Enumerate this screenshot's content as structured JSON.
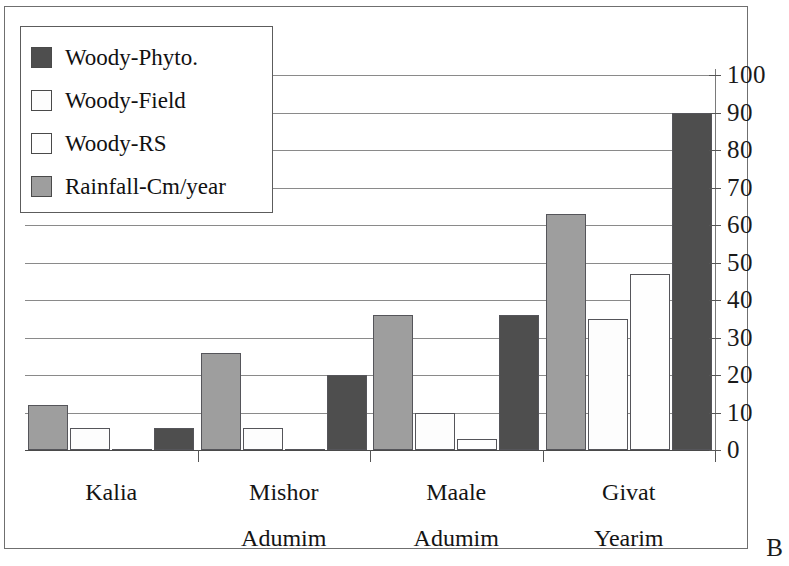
{
  "chart_data": {
    "type": "bar",
    "title": "",
    "subtitle": "",
    "xlabel": "",
    "ylabel": "",
    "ylim": [
      0,
      100
    ],
    "ytick_step": 10,
    "yticks": [
      "100",
      "90",
      "80",
      "70",
      "60",
      "50",
      "40",
      "30",
      "20",
      "10",
      "0"
    ],
    "grid": true,
    "legend_position": "top-left",
    "categories": [
      "Kalia",
      "Mishor Adumim",
      "Maale Adumim",
      "Givat Yearim"
    ],
    "category_lines": [
      {
        "line1": "Kalia",
        "line2": ""
      },
      {
        "line1": "Mishor",
        "line2": "Adumim"
      },
      {
        "line1": "Maale",
        "line2": "Adumim"
      },
      {
        "line1": "Givat",
        "line2": "Yearim"
      }
    ],
    "series": [
      {
        "name": "Woody-Phyto.",
        "color": "#4e4e4e",
        "values": [
          6,
          20,
          36,
          90
        ]
      },
      {
        "name": "Woody-Field",
        "color": "#fdfdfd",
        "values": [
          6,
          6,
          10,
          35
        ]
      },
      {
        "name": "Woody-RS",
        "color": "#fefefe",
        "values": [
          0,
          0,
          3,
          47
        ]
      },
      {
        "name": "Rainfall-Cm/year",
        "color": "#9e9e9e",
        "values": [
          12,
          26,
          36,
          63
        ]
      }
    ],
    "series_draw_order": [
      "Rainfall-Cm/year",
      "Woody-Field",
      "Woody-RS",
      "Woody-Phyto."
    ],
    "annotations": [
      {
        "name": "panel-letter",
        "text": "B"
      }
    ]
  },
  "legend": {
    "items": [
      {
        "label": "Woody-Phyto.",
        "swatch_color": "#4e4e4e",
        "swatch_name": "legend-swatch-woody-phyto"
      },
      {
        "label": "Woody-Field",
        "swatch_color": "#fdfdfd",
        "swatch_name": "legend-swatch-woody-field"
      },
      {
        "label": "Woody-RS",
        "swatch_color": "#fefefe",
        "swatch_name": "legend-swatch-woody-rs"
      },
      {
        "label": "Rainfall-Cm/year",
        "swatch_color": "#9e9e9e",
        "swatch_name": "legend-swatch-rainfall"
      }
    ]
  },
  "panel": {
    "letter": "B"
  }
}
